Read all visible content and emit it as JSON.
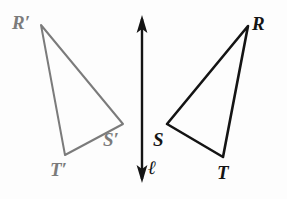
{
  "figure": {
    "kind": "reflection-diagram",
    "background_color": "#fdfdfd",
    "width": 287,
    "height": 199
  },
  "mirror_line": {
    "label": "ℓ",
    "color": "#141414",
    "x": 142,
    "y_top": 15,
    "y_bottom": 183,
    "stroke_width": 2.4,
    "arrow_both_ends": true,
    "label_position": {
      "left": 148,
      "top": 158
    }
  },
  "preimage_triangle": {
    "name": "triangle-RST",
    "color": "#141414",
    "stroke_width": 2.6,
    "vertices": [
      {
        "id": "R",
        "label": "R",
        "x": 248,
        "y": 26,
        "label_position": {
          "left": 252,
          "top": 14
        }
      },
      {
        "id": "S",
        "label": "S",
        "x": 167,
        "y": 124,
        "label_position": {
          "left": 153,
          "top": 130
        }
      },
      {
        "id": "T",
        "label": "T",
        "x": 223,
        "y": 157,
        "label_position": {
          "left": 217,
          "top": 163
        }
      }
    ]
  },
  "image_triangle": {
    "name": "triangle-R-prime-S-prime-T-prime",
    "color": "#7b7b7b",
    "stroke_width": 2.0,
    "vertices": [
      {
        "id": "R-prime",
        "label": "R′",
        "x": 41,
        "y": 25,
        "label_position": {
          "left": 12,
          "top": 13
        }
      },
      {
        "id": "S-prime",
        "label": "S′",
        "x": 123,
        "y": 124,
        "label_position": {
          "left": 103,
          "top": 130
        }
      },
      {
        "id": "T-prime",
        "label": "T′",
        "x": 65,
        "y": 155,
        "label_position": {
          "left": 50,
          "top": 160
        }
      }
    ]
  }
}
